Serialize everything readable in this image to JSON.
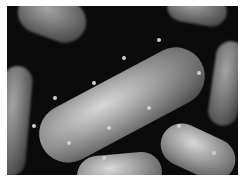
{
  "image": {
    "description": "3D rendering of rod-shaped bacteria covered with bacteriophages on a black background",
    "colors": {
      "background": "#0b0b0b",
      "cell": "#a5a5a5",
      "border": "#ffffff"
    }
  }
}
